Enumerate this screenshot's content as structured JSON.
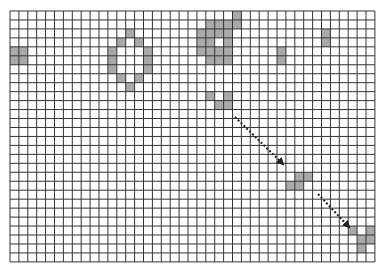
{
  "board": {
    "origin_x": 10,
    "origin_y": 11,
    "cols": 41,
    "rows": 28,
    "cell_w": 8.9,
    "cell_h": 8.96,
    "grid_line_color": "#333333",
    "cell_fill_color": "#a9a9a9",
    "background_color": "#ffffff"
  },
  "shaded_cells": [
    {
      "r": 4,
      "c": 0
    },
    {
      "r": 4,
      "c": 1
    },
    {
      "r": 5,
      "c": 0
    },
    {
      "r": 5,
      "c": 1
    },
    {
      "r": 2,
      "c": 13
    },
    {
      "r": 3,
      "c": 12
    },
    {
      "r": 3,
      "c": 14
    },
    {
      "r": 4,
      "c": 11
    },
    {
      "r": 4,
      "c": 15
    },
    {
      "r": 5,
      "c": 11
    },
    {
      "r": 5,
      "c": 15
    },
    {
      "r": 6,
      "c": 11
    },
    {
      "r": 6,
      "c": 15
    },
    {
      "r": 7,
      "c": 12
    },
    {
      "r": 7,
      "c": 14
    },
    {
      "r": 8,
      "c": 13
    },
    {
      "r": 0,
      "c": 25
    },
    {
      "r": 1,
      "c": 22
    },
    {
      "r": 1,
      "c": 23
    },
    {
      "r": 1,
      "c": 24
    },
    {
      "r": 1,
      "c": 25
    },
    {
      "r": 2,
      "c": 21
    },
    {
      "r": 2,
      "c": 22
    },
    {
      "r": 2,
      "c": 23
    },
    {
      "r": 2,
      "c": 24
    },
    {
      "r": 3,
      "c": 21
    },
    {
      "r": 3,
      "c": 22
    },
    {
      "r": 3,
      "c": 24
    },
    {
      "r": 4,
      "c": 21
    },
    {
      "r": 4,
      "c": 22
    },
    {
      "r": 4,
      "c": 23
    },
    {
      "r": 4,
      "c": 24
    },
    {
      "r": 5,
      "c": 22
    },
    {
      "r": 5,
      "c": 23
    },
    {
      "r": 5,
      "c": 24
    },
    {
      "r": 4,
      "c": 30
    },
    {
      "r": 5,
      "c": 30
    },
    {
      "r": 2,
      "c": 35
    },
    {
      "r": 3,
      "c": 35
    },
    {
      "r": 9,
      "c": 22
    },
    {
      "r": 9,
      "c": 24
    },
    {
      "r": 10,
      "c": 23
    },
    {
      "r": 10,
      "c": 24
    },
    {
      "r": 18,
      "c": 32
    },
    {
      "r": 18,
      "c": 33
    },
    {
      "r": 19,
      "c": 31
    },
    {
      "r": 19,
      "c": 32
    },
    {
      "r": 24,
      "c": 38
    },
    {
      "r": 24,
      "c": 40
    },
    {
      "r": 25,
      "c": 39
    },
    {
      "r": 25,
      "c": 40
    },
    {
      "r": 26,
      "c": 39
    }
  ],
  "arrows": [
    {
      "name": "arrow-1",
      "x1": 235,
      "y1": 117,
      "x2": 283,
      "y2": 164,
      "color": "#222222"
    },
    {
      "name": "arrow-2",
      "x1": 318,
      "y1": 194,
      "x2": 349,
      "y2": 227,
      "color": "#222222"
    }
  ]
}
